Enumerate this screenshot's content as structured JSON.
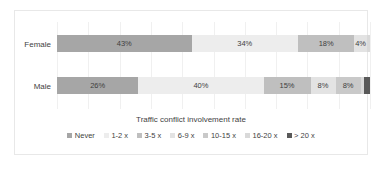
{
  "chart_data": {
    "type": "bar",
    "orientation": "horizontal",
    "stacked": true,
    "normalized_percent": true,
    "title": "",
    "xlabel": "Traffic conflict involvement rate",
    "ylabel": "",
    "categories": [
      "Female",
      "Male"
    ],
    "xlim": [
      0,
      100
    ],
    "grid": true,
    "grid_axis": "x",
    "gridline_step": 10,
    "legend_position": "bottom",
    "series": [
      {
        "name": "Never",
        "color": "#a6a6a6",
        "values": [
          43,
          26
        ],
        "labels": [
          "43%",
          "26%"
        ]
      },
      {
        "name": "1-2 x",
        "color": "#ededed",
        "values": [
          34,
          40
        ],
        "labels": [
          "34%",
          "40%"
        ]
      },
      {
        "name": "3-5 x",
        "color": "#bfbfbf",
        "values": [
          18,
          15
        ],
        "labels": [
          "18%",
          "15%"
        ]
      },
      {
        "name": "6-9 x",
        "color": "#e3e3e3",
        "values": [
          4,
          8
        ],
        "labels": [
          "4%",
          "8%"
        ]
      },
      {
        "name": "10-15 x",
        "color": "#c9c9c9",
        "values": [
          0,
          8
        ],
        "labels": [
          "",
          "8%"
        ]
      },
      {
        "name": "16-20 x",
        "color": "#d9d9d9",
        "values": [
          1,
          1
        ],
        "labels": [
          "",
          ""
        ]
      },
      {
        "name": "> 20 x",
        "color": "#595959",
        "values": [
          0,
          2
        ],
        "labels": [
          "",
          ""
        ]
      }
    ]
  },
  "axis": {
    "x_title": "Traffic conflict involvement rate",
    "category_labels": [
      "Female",
      "Male"
    ]
  },
  "legend": {
    "items": [
      {
        "label": "Never",
        "color": "#a6a6a6"
      },
      {
        "label": "1-2 x",
        "color": "#ededed"
      },
      {
        "label": "3-5 x",
        "color": "#bfbfbf"
      },
      {
        "label": "6-9 x",
        "color": "#e3e3e3"
      },
      {
        "label": "10-15 x",
        "color": "#c9c9c9"
      },
      {
        "label": "16-20 x",
        "color": "#d9d9d9"
      },
      {
        "label": "> 20 x",
        "color": "#595959"
      }
    ]
  },
  "colors": {
    "frame_border": "#e8e8e8",
    "gridline": "#f0f0f0",
    "text": "#3f3f3f",
    "background": "#ffffff"
  }
}
